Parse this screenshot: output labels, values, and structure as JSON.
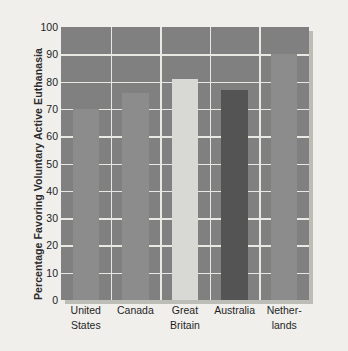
{
  "chart_data": {
    "type": "bar",
    "title": "",
    "subtitle": "",
    "xlabel": "",
    "ylabel": "Percentage Favoring Voluntary Active Euthanasia",
    "categories": [
      "United States",
      "Canada",
      "Great Britain",
      "Australia",
      "Netherlands"
    ],
    "category_lines": [
      [
        "United",
        "States"
      ],
      [
        "Canada",
        ""
      ],
      [
        "Great",
        "Britain"
      ],
      [
        "Australia",
        ""
      ],
      [
        "Nether-",
        "lands"
      ]
    ],
    "values": [
      70,
      76,
      81,
      77,
      90
    ],
    "ylim": [
      0,
      100
    ],
    "ytick_values": [
      0,
      10,
      20,
      30,
      40,
      50,
      60,
      70,
      80,
      90,
      100
    ],
    "ytick_labels": [
      "0",
      "10",
      "20",
      "30",
      "40",
      "50",
      "60",
      "70",
      "80",
      "90",
      "100"
    ],
    "grid": true,
    "grid_orientation": "horizontal",
    "legend": null,
    "legend_position": "none",
    "bar_colors": [
      "#8c8c8c",
      "#8c8c8c",
      "#d8d8d4",
      "#545454",
      "#8c8c8c"
    ],
    "plot_background": "#808080",
    "grid_color": "#e9e9e4",
    "page_background": "#f0efec",
    "shadow_color": "#bdbdb8"
  }
}
